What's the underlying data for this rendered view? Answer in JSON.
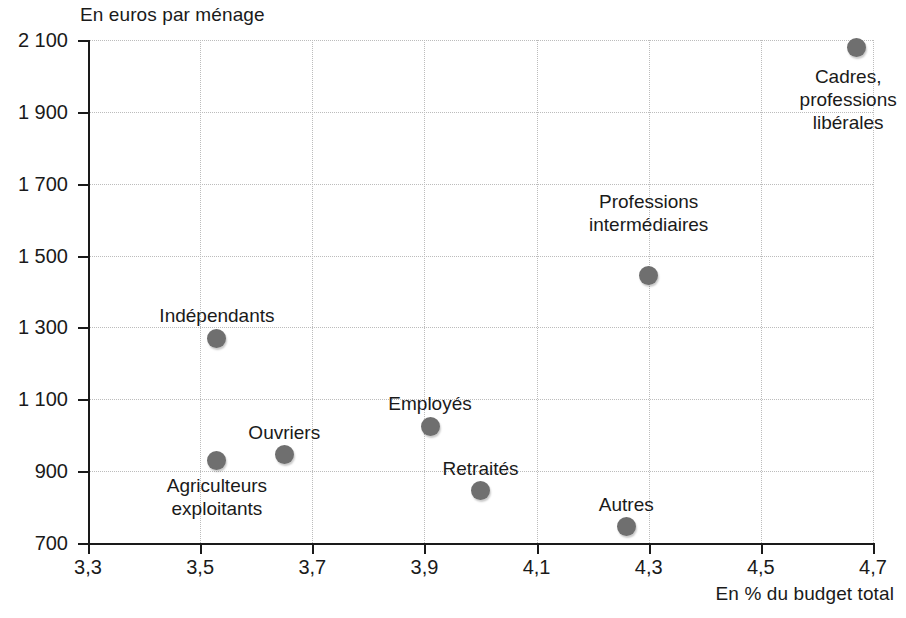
{
  "chart_data": {
    "type": "scatter",
    "title": "",
    "xlabel": "En % du budget total",
    "ylabel": "En euros par ménage",
    "xlim": [
      3.3,
      4.7
    ],
    "ylim": [
      700,
      2100
    ],
    "xticks": [
      "3,3",
      "3,5",
      "3,7",
      "3,9",
      "4,1",
      "4,3",
      "4,5",
      "4,7"
    ],
    "xtick_values": [
      3.3,
      3.5,
      3.7,
      3.9,
      4.1,
      4.3,
      4.5,
      4.7
    ],
    "yticks": [
      "700",
      "900",
      "1 100",
      "1 300",
      "1 500",
      "1 700",
      "1 900",
      "2 100"
    ],
    "ytick_values": [
      700,
      900,
      1100,
      1300,
      1500,
      1700,
      1900,
      2100
    ],
    "grid": true,
    "legend": "none",
    "marker_color": "#6f6f6f",
    "points": [
      {
        "name": "cadres-professions-liberales",
        "label": "Cadres,\nprofessions\nlibérales",
        "x": 4.67,
        "y": 2080,
        "label_align": "center",
        "label_dx": -8,
        "label_dy": 18
      },
      {
        "name": "professions-intermediaires",
        "label": "Professions\nintermédiaires",
        "x": 4.3,
        "y": 1445,
        "label_align": "center",
        "label_dx": 0,
        "label_dy": -62
      },
      {
        "name": "independants",
        "label": "Indépendants",
        "x": 3.53,
        "y": 1270,
        "label_align": "center",
        "label_dx": 0,
        "label_dy": -34
      },
      {
        "name": "employes",
        "label": "Employés",
        "x": 3.91,
        "y": 1025,
        "label_align": "center",
        "label_dx": 0,
        "label_dy": -34
      },
      {
        "name": "ouvriers",
        "label": "Ouvriers",
        "x": 3.65,
        "y": 945,
        "label_align": "center",
        "label_dx": 0,
        "label_dy": -34
      },
      {
        "name": "agriculteurs-exploitants",
        "label": "Agriculteurs\nexploitants",
        "x": 3.53,
        "y": 930,
        "label_align": "center",
        "label_dx": 0,
        "label_dy": 14
      },
      {
        "name": "retraites",
        "label": "Retraités",
        "x": 4.0,
        "y": 845,
        "label_align": "center",
        "label_dx": 0,
        "label_dy": -34
      },
      {
        "name": "autres",
        "label": "Autres",
        "x": 4.26,
        "y": 745,
        "label_align": "center",
        "label_dx": 0,
        "label_dy": -34
      }
    ]
  }
}
